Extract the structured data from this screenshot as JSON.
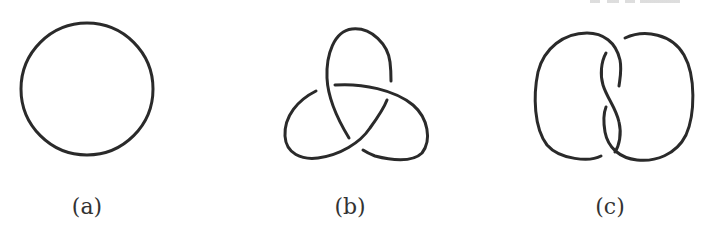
{
  "figure": {
    "panels": [
      {
        "id": "a",
        "label": "(a)",
        "description": "unknot (circle)"
      },
      {
        "id": "b",
        "label": "(b)",
        "description": "trefoil knot"
      },
      {
        "id": "c",
        "label": "(c)",
        "description": "figure-eight knot"
      }
    ],
    "stroke_color": "#2a2a2a",
    "background_color": "#ffffff"
  }
}
